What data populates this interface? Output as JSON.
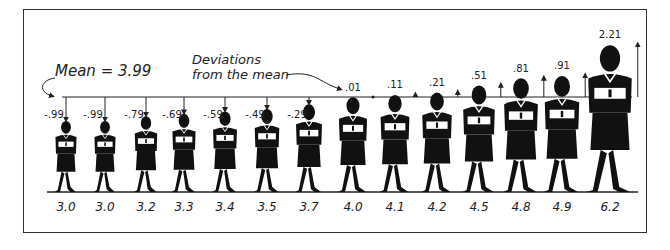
{
  "annotations": {
    "mean_label": "Mean = 3.99",
    "deviation_label_line1": "Deviations",
    "deviation_label_line2": "from the mean"
  },
  "chart_data": {
    "type": "pictograph",
    "title": "",
    "mean": 3.99,
    "categories": [
      "3.0",
      "3.0",
      "3.2",
      "3.3",
      "3.4",
      "3.5",
      "3.7",
      "4.0",
      "4.1",
      "4.2",
      "4.5",
      "4.8",
      "4.9",
      "6.2"
    ],
    "values": [
      3.0,
      3.0,
      3.2,
      3.3,
      3.4,
      3.5,
      3.7,
      4.0,
      4.1,
      4.2,
      4.5,
      4.8,
      4.9,
      6.2
    ],
    "deviations": [
      "-.99",
      "-.99",
      "-.79",
      "-.69",
      "-.59",
      "-.49",
      "-.29",
      ".01",
      ".11",
      ".21",
      ".51",
      ".81",
      ".91",
      "2.21"
    ],
    "deviation_values": [
      -0.99,
      -0.99,
      -0.79,
      -0.69,
      -0.59,
      -0.49,
      -0.29,
      0.01,
      0.11,
      0.21,
      0.51,
      0.81,
      0.91,
      2.21
    ]
  },
  "colors": {
    "ink": "#111111",
    "frame": "#333333",
    "background": "#ffffff"
  }
}
